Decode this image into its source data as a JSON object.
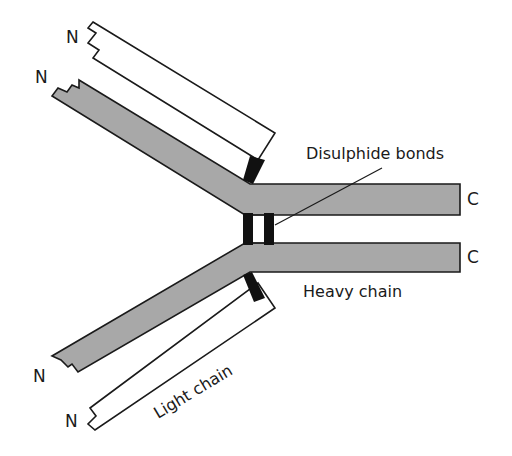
{
  "diagram": {
    "type": "antibody-structure",
    "labels": {
      "n_terminus": "N",
      "c_terminus": "C",
      "disulphide_bonds": "Disulphide bonds",
      "heavy_chain": "Heavy chain",
      "light_chain": "Light chain"
    },
    "colors": {
      "heavy_chain_fill": "#a8a8a8",
      "light_chain_fill": "#ffffff",
      "bond_fill": "#111111",
      "outline": "#1a1a1a"
    },
    "components": [
      {
        "name": "upper-light-chain",
        "kind": "light chain",
        "terminus_left": "N"
      },
      {
        "name": "upper-heavy-chain",
        "kind": "heavy chain",
        "terminus_left": "N",
        "terminus_right": "C"
      },
      {
        "name": "lower-heavy-chain",
        "kind": "heavy chain",
        "terminus_left": "N",
        "terminus_right": "C"
      },
      {
        "name": "lower-light-chain",
        "kind": "light chain",
        "terminus_left": "N"
      }
    ]
  }
}
